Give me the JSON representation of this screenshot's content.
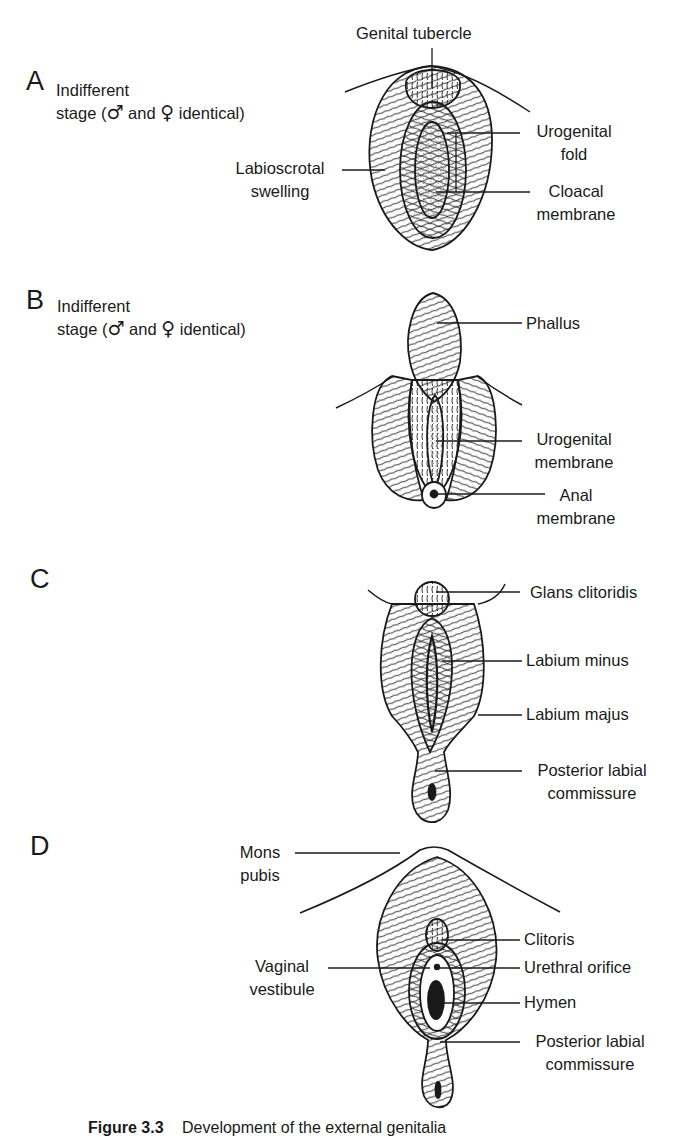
{
  "figure": {
    "caption_number": "Figure 3.3",
    "caption_text": "Development of the external genitalia"
  },
  "panels": [
    {
      "letter": "A",
      "stage_line1": "Indifferent",
      "stage_line2_pre": "stage (",
      "male_symbol": "♂",
      "stage_and": "and",
      "female_symbol": "♀",
      "stage_line2_post": "identical)",
      "labels": {
        "genital_tubercle": "Genital tubercle",
        "urogenital_fold_1": "Urogenital",
        "urogenital_fold_2": "fold",
        "labioscrotal_1": "Labioscrotal",
        "labioscrotal_2": "swelling",
        "cloacal_1": "Cloacal",
        "cloacal_2": "membrane"
      }
    },
    {
      "letter": "B",
      "stage_line1": "Indifferent",
      "stage_line2_pre": "stage (",
      "male_symbol": "♂",
      "stage_and": "and",
      "female_symbol": "♀",
      "stage_line2_post": "identical)",
      "labels": {
        "phallus": "Phallus",
        "urogenital_membrane_1": "Urogenital",
        "urogenital_membrane_2": "membrane",
        "anal_membrane_1": "Anal",
        "anal_membrane_2": "membrane"
      }
    },
    {
      "letter": "C",
      "labels": {
        "glans_clitoridis": "Glans clitoridis",
        "labium_minus": "Labium minus",
        "labium_majus": "Labium majus",
        "posterior_commissure_1": "Posterior labial",
        "posterior_commissure_2": "commissure"
      }
    },
    {
      "letter": "D",
      "labels": {
        "mons_1": "Mons",
        "mons_2": "pubis",
        "clitoris": "Clitoris",
        "vestibule_1": "Vaginal",
        "vestibule_2": "vestibule",
        "urethral_orifice": "Urethral orifice",
        "hymen": "Hymen",
        "posterior_commissure_1": "Posterior labial",
        "posterior_commissure_2": "commissure"
      }
    }
  ],
  "colors": {
    "ink": "#1a1a1a",
    "background": "#ffffff",
    "stipple": "#555555"
  }
}
